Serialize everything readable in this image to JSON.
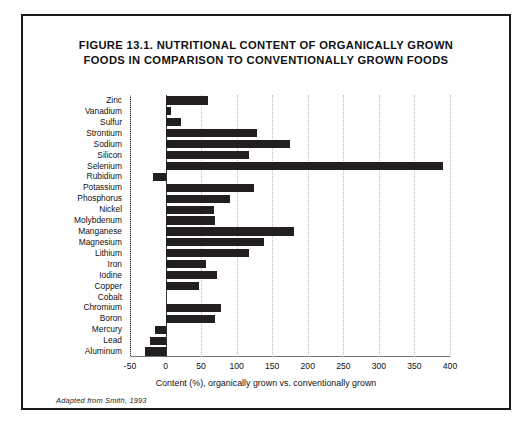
{
  "figure": {
    "title_line1": "FIGURE 13.1.  NUTRITIONAL CONTENT OF ORGANICALLY GROWN",
    "title_line2": "FOODS IN COMPARISON TO CONVENTIONALLY GROWN FOODS",
    "source_note": "Adapted from Smith, 1993",
    "border_color": "#1a1a1a",
    "bar_color": "#231f20",
    "background": "#ffffff"
  },
  "chart_data": {
    "type": "bar",
    "orientation": "horizontal",
    "title": "FIGURE 13.1. NUTRITIONAL CONTENT OF ORGANICALLY GROWN FOODS IN COMPARISON TO CONVENTIONALLY GROWN FOODS",
    "xlabel": "Content (%), organically grown vs. conventionally grown",
    "ylabel": "",
    "xlim": [
      -50,
      400
    ],
    "xticks": [
      -50,
      0,
      50,
      100,
      150,
      200,
      250,
      300,
      350,
      400
    ],
    "xtick_labels": [
      "-50",
      "0",
      "50",
      "100",
      "150",
      "200",
      "250",
      "300",
      "350",
      "400"
    ],
    "grid": "vertical-dotted",
    "legend": "none",
    "categories": [
      "Zinc",
      "Vanadium",
      "Sulfur",
      "Strontium",
      "Sodium",
      "Silicon",
      "Selenium",
      "Rubidium",
      "Potassium",
      "Phosphorus",
      "Nickel",
      "Molybdenum",
      "Manganese",
      "Magnesium",
      "Lithium",
      "Iron",
      "Iodine",
      "Copper",
      "Cobalt",
      "Chromium",
      "Boron",
      "Mercury",
      "Lead",
      "Aluminum"
    ],
    "values": [
      60,
      8,
      22,
      128,
      175,
      118,
      390,
      -18,
      125,
      91,
      68,
      70,
      180,
      138,
      118,
      57,
      73,
      47,
      0,
      78,
      70,
      -15,
      -22,
      -29
    ]
  }
}
